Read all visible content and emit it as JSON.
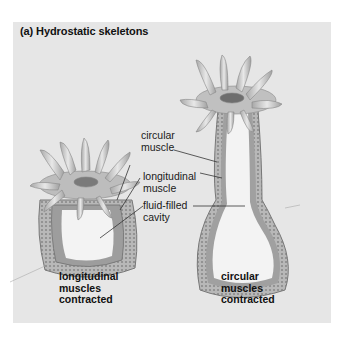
{
  "figure": {
    "title": "(a) Hydrostatic skeletons",
    "labels": {
      "circular_muscle": [
        "circular",
        "muscle"
      ],
      "longitudinal_muscle": [
        "longitudinal",
        "muscle"
      ],
      "fluid_filled_cavity": [
        "fluid-filled",
        "cavity"
      ]
    },
    "captions": {
      "left": [
        "longitudinal",
        "muscles",
        "contracted"
      ],
      "right": [
        "circular",
        "muscles",
        "contracted"
      ]
    },
    "colors": {
      "panel": "#e6e6e6",
      "body_wall": "#9a9a9a",
      "cavity": "#f2f2f2",
      "tentacle": "#cfcfcf",
      "leader_line": "#333333"
    }
  }
}
